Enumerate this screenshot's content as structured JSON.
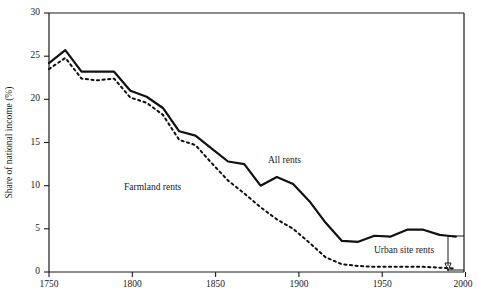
{
  "chart_data": {
    "type": "line",
    "title": "",
    "subtitle": "",
    "xlabel": "",
    "ylabel": "Share of national income (%)",
    "xlim": [
      1750,
      2005
    ],
    "ylim": [
      0,
      30
    ],
    "xticks": [
      1750,
      1800,
      1850,
      1900,
      1950,
      2000
    ],
    "xtick_labels": [
      "1750",
      "1800",
      "1850",
      "1900",
      "1950",
      "2000"
    ],
    "yticks": [
      0,
      5,
      10,
      15,
      20,
      25,
      30
    ],
    "ytick_labels": [
      "0",
      "5",
      "10",
      "15",
      "20",
      "25",
      "30"
    ],
    "grid": false,
    "legend_position": "inline-annotations",
    "series": [
      {
        "name": "All rents",
        "style": "solid",
        "color": "#111111",
        "x": [
          1750,
          1760,
          1770,
          1780,
          1790,
          1800,
          1810,
          1820,
          1830,
          1840,
          1850,
          1860,
          1870,
          1880,
          1890,
          1900,
          1910,
          1920,
          1930,
          1940,
          1950,
          1960,
          1970,
          1980,
          1990,
          1995,
          2000
        ],
        "y": [
          24.2,
          25.7,
          23.2,
          23.2,
          23.2,
          21.0,
          20.3,
          19.0,
          16.3,
          15.8,
          14.3,
          12.8,
          12.5,
          10.0,
          11.0,
          10.2,
          8.2,
          5.7,
          3.6,
          3.5,
          4.2,
          4.1,
          4.9,
          4.9,
          4.3,
          4.2,
          4.1
        ]
      },
      {
        "name": "Farmland rents",
        "style": "dotted",
        "color": "#111111",
        "x": [
          1750,
          1760,
          1770,
          1780,
          1790,
          1800,
          1810,
          1820,
          1830,
          1840,
          1850,
          1860,
          1870,
          1880,
          1890,
          1900,
          1910,
          1920,
          1930,
          1940,
          1950,
          1960,
          1970,
          1980,
          1990,
          2000
        ],
        "y": [
          23.5,
          24.8,
          22.4,
          22.2,
          22.4,
          20.2,
          19.6,
          18.2,
          15.3,
          14.7,
          12.6,
          10.6,
          9.1,
          7.5,
          6.1,
          5.0,
          3.4,
          1.7,
          0.9,
          0.7,
          0.6,
          0.6,
          0.6,
          0.6,
          0.5,
          0.4
        ]
      }
    ],
    "annotations": [
      {
        "name": "all-rents-label",
        "text": "All rents",
        "x": 1900,
        "y": 14.0
      },
      {
        "name": "farmland-rents-label",
        "text": "Farmland rents",
        "x": 1795,
        "y": 10.2
      },
      {
        "name": "urban-site-rents-label",
        "text": "Urban site rents",
        "x": 1962,
        "y": 2.6
      },
      {
        "name": "urban-site-rents-arrow",
        "text": "",
        "x": 1995,
        "y": 0.5
      }
    ]
  }
}
